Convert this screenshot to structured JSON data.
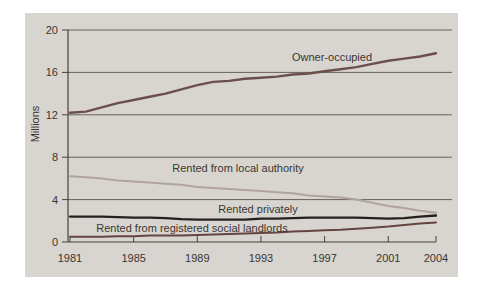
{
  "figure": {
    "background": "#ffffff",
    "panel_bg": "#d8d5d0"
  },
  "chart_data": {
    "type": "line",
    "title": "",
    "ylabel": "Millions",
    "xlabel": "",
    "ylim": [
      0,
      20
    ],
    "xlim": [
      1981,
      2004
    ],
    "yticks": [
      0,
      4,
      8,
      12,
      16,
      20
    ],
    "xticks": [
      1981,
      1985,
      1989,
      1993,
      1997,
      2001,
      2004
    ],
    "grid": true,
    "legend": "inline-labels",
    "x": [
      1981,
      1982,
      1983,
      1984,
      1985,
      1986,
      1987,
      1988,
      1989,
      1990,
      1991,
      1992,
      1993,
      1994,
      1995,
      1996,
      1997,
      1998,
      1999,
      2000,
      2001,
      2002,
      2003,
      2004
    ],
    "series": [
      {
        "name": "Owner-occupied",
        "color": "#6a4f4c",
        "stroke_width": 2.4,
        "values": [
          12.2,
          12.3,
          12.7,
          13.1,
          13.4,
          13.7,
          14.0,
          14.4,
          14.8,
          15.1,
          15.2,
          15.4,
          15.5,
          15.6,
          15.8,
          15.9,
          16.1,
          16.3,
          16.5,
          16.8,
          17.1,
          17.3,
          17.5,
          17.8
        ],
        "label": {
          "text": "Owner-occupied",
          "x": 332,
          "y": 61
        }
      },
      {
        "name": "Rented from local authority",
        "color": "#b1a39d",
        "stroke_width": 2.0,
        "values": [
          6.2,
          6.1,
          6.0,
          5.8,
          5.7,
          5.6,
          5.5,
          5.4,
          5.2,
          5.1,
          5.0,
          4.9,
          4.8,
          4.7,
          4.6,
          4.4,
          4.3,
          4.2,
          4.0,
          3.7,
          3.4,
          3.2,
          2.95,
          2.75
        ],
        "label": {
          "text": "Rented from local authority",
          "x": 238,
          "y": 172
        }
      },
      {
        "name": "Rented privately",
        "color": "#23201e",
        "stroke_width": 2.3,
        "values": [
          2.4,
          2.4,
          2.4,
          2.35,
          2.3,
          2.3,
          2.25,
          2.15,
          2.1,
          2.1,
          2.1,
          2.1,
          2.2,
          2.2,
          2.25,
          2.3,
          2.3,
          2.3,
          2.3,
          2.25,
          2.2,
          2.25,
          2.4,
          2.5
        ],
        "label": {
          "text": "Rented privately",
          "x": 258,
          "y": 213
        }
      },
      {
        "name": "Rented from registered social landlords",
        "color": "#644542",
        "stroke_width": 2.0,
        "values": [
          0.5,
          0.5,
          0.5,
          0.55,
          0.55,
          0.6,
          0.6,
          0.6,
          0.65,
          0.7,
          0.75,
          0.8,
          0.85,
          0.9,
          1.0,
          1.05,
          1.1,
          1.15,
          1.25,
          1.35,
          1.45,
          1.6,
          1.75,
          1.85
        ],
        "label": {
          "text": "Rented from registered social landlords",
          "x": 192,
          "y": 232
        }
      }
    ],
    "colors": {
      "grid": "#59524c",
      "axis": "#474038",
      "text": "#3b3530"
    }
  }
}
